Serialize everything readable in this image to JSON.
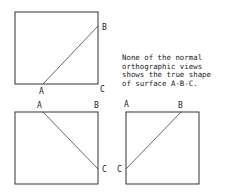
{
  "note": {
    "lines": [
      "None of the normal",
      "orthographic views",
      "shows the true shape",
      "of surface A-B-C."
    ]
  },
  "views": [
    {
      "name": "top-left-view",
      "labels": {
        "a": "A",
        "b": "B",
        "c": "C"
      }
    },
    {
      "name": "bottom-left-view",
      "labels": {
        "a": "A",
        "b": "B",
        "c": "C"
      }
    },
    {
      "name": "bottom-right-view",
      "labels": {
        "a": "A",
        "b": "B",
        "c": "C"
      }
    }
  ],
  "colors": {
    "line": "#333333",
    "text": "#222222",
    "background": "#ffffff"
  }
}
